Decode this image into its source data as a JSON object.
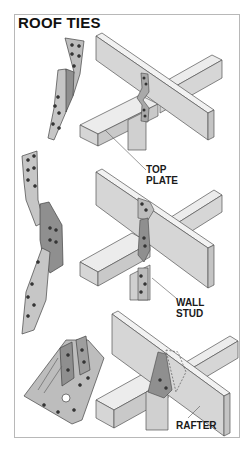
{
  "title": "ROOF TIES",
  "labels": {
    "top_plate": [
      "TOP",
      "PLATE"
    ],
    "wall_stud": [
      "WALL",
      "STUD"
    ],
    "rafter": "RAFTER"
  },
  "colors": {
    "frame_border": "#b8b8b8",
    "wood_top": "#ececec",
    "wood_face": "#d6d6d6",
    "wood_side": "#c4c4c4",
    "metal_light": "#bdbdbd",
    "metal_dark": "#8f8f8f",
    "outline": "#555555",
    "text": "#111111"
  },
  "panels": [
    {
      "name": "twisted-strap-tie",
      "connector": "twisted strap tie",
      "label": "TOP PLATE"
    },
    {
      "name": "hurricane-tie",
      "connector": "hurricane tie",
      "label": "WALL STUD"
    },
    {
      "name": "rafter-clip",
      "connector": "rafter angle clip",
      "label": "RAFTER"
    }
  ]
}
